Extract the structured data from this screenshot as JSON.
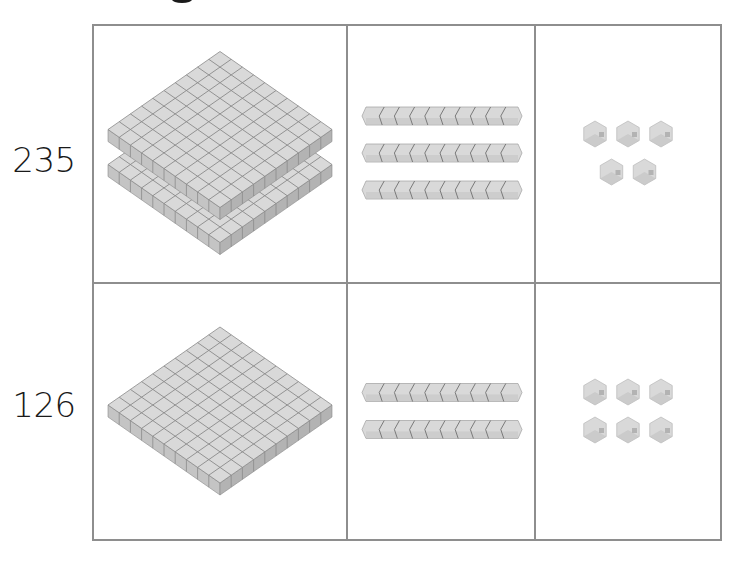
{
  "heading_fragment": "g",
  "table": {
    "columns": [
      "hundreds",
      "tens",
      "ones"
    ],
    "rows": [
      {
        "label": "235",
        "hundreds": 2,
        "tens": 3,
        "ones": 5
      },
      {
        "label": "126",
        "hundreds": 1,
        "tens": 2,
        "ones": 6
      }
    ]
  },
  "colors": {
    "border": "#8e8e8e",
    "block_top": "#d9d9d9",
    "block_side_left": "#c4c4c4",
    "block_side_right": "#b3b3b3",
    "block_grid_line": "#8a8a8a",
    "label_text": "#1a1a1a"
  },
  "icons": {
    "hundreds": "hundred-flat-icon",
    "tens": "ten-rod-icon",
    "ones": "unit-cube-icon"
  }
}
